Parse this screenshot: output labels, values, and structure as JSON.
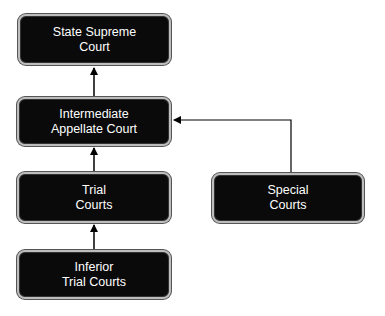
{
  "diagram": {
    "type": "court-hierarchy-flowchart",
    "nodes": [
      {
        "id": "state_supreme",
        "line1": "State Supreme",
        "line2": "Court"
      },
      {
        "id": "intermediate",
        "line1": "Intermediate",
        "line2": "Appellate Court"
      },
      {
        "id": "trial",
        "line1": "Trial",
        "line2": "Courts"
      },
      {
        "id": "special",
        "line1": "Special",
        "line2": "Courts"
      },
      {
        "id": "inferior",
        "line1": "Inferior",
        "line2": "Trial Courts"
      }
    ],
    "edges": [
      {
        "from": "intermediate",
        "to": "state_supreme"
      },
      {
        "from": "trial",
        "to": "intermediate"
      },
      {
        "from": "special",
        "to": "intermediate"
      },
      {
        "from": "inferior",
        "to": "trial"
      }
    ]
  },
  "colors": {
    "box_fill": "#0a0a0a",
    "box_border": "#bdbdbd",
    "text": "#ffffff",
    "arrow": "#000000",
    "background": "#ffffff"
  }
}
